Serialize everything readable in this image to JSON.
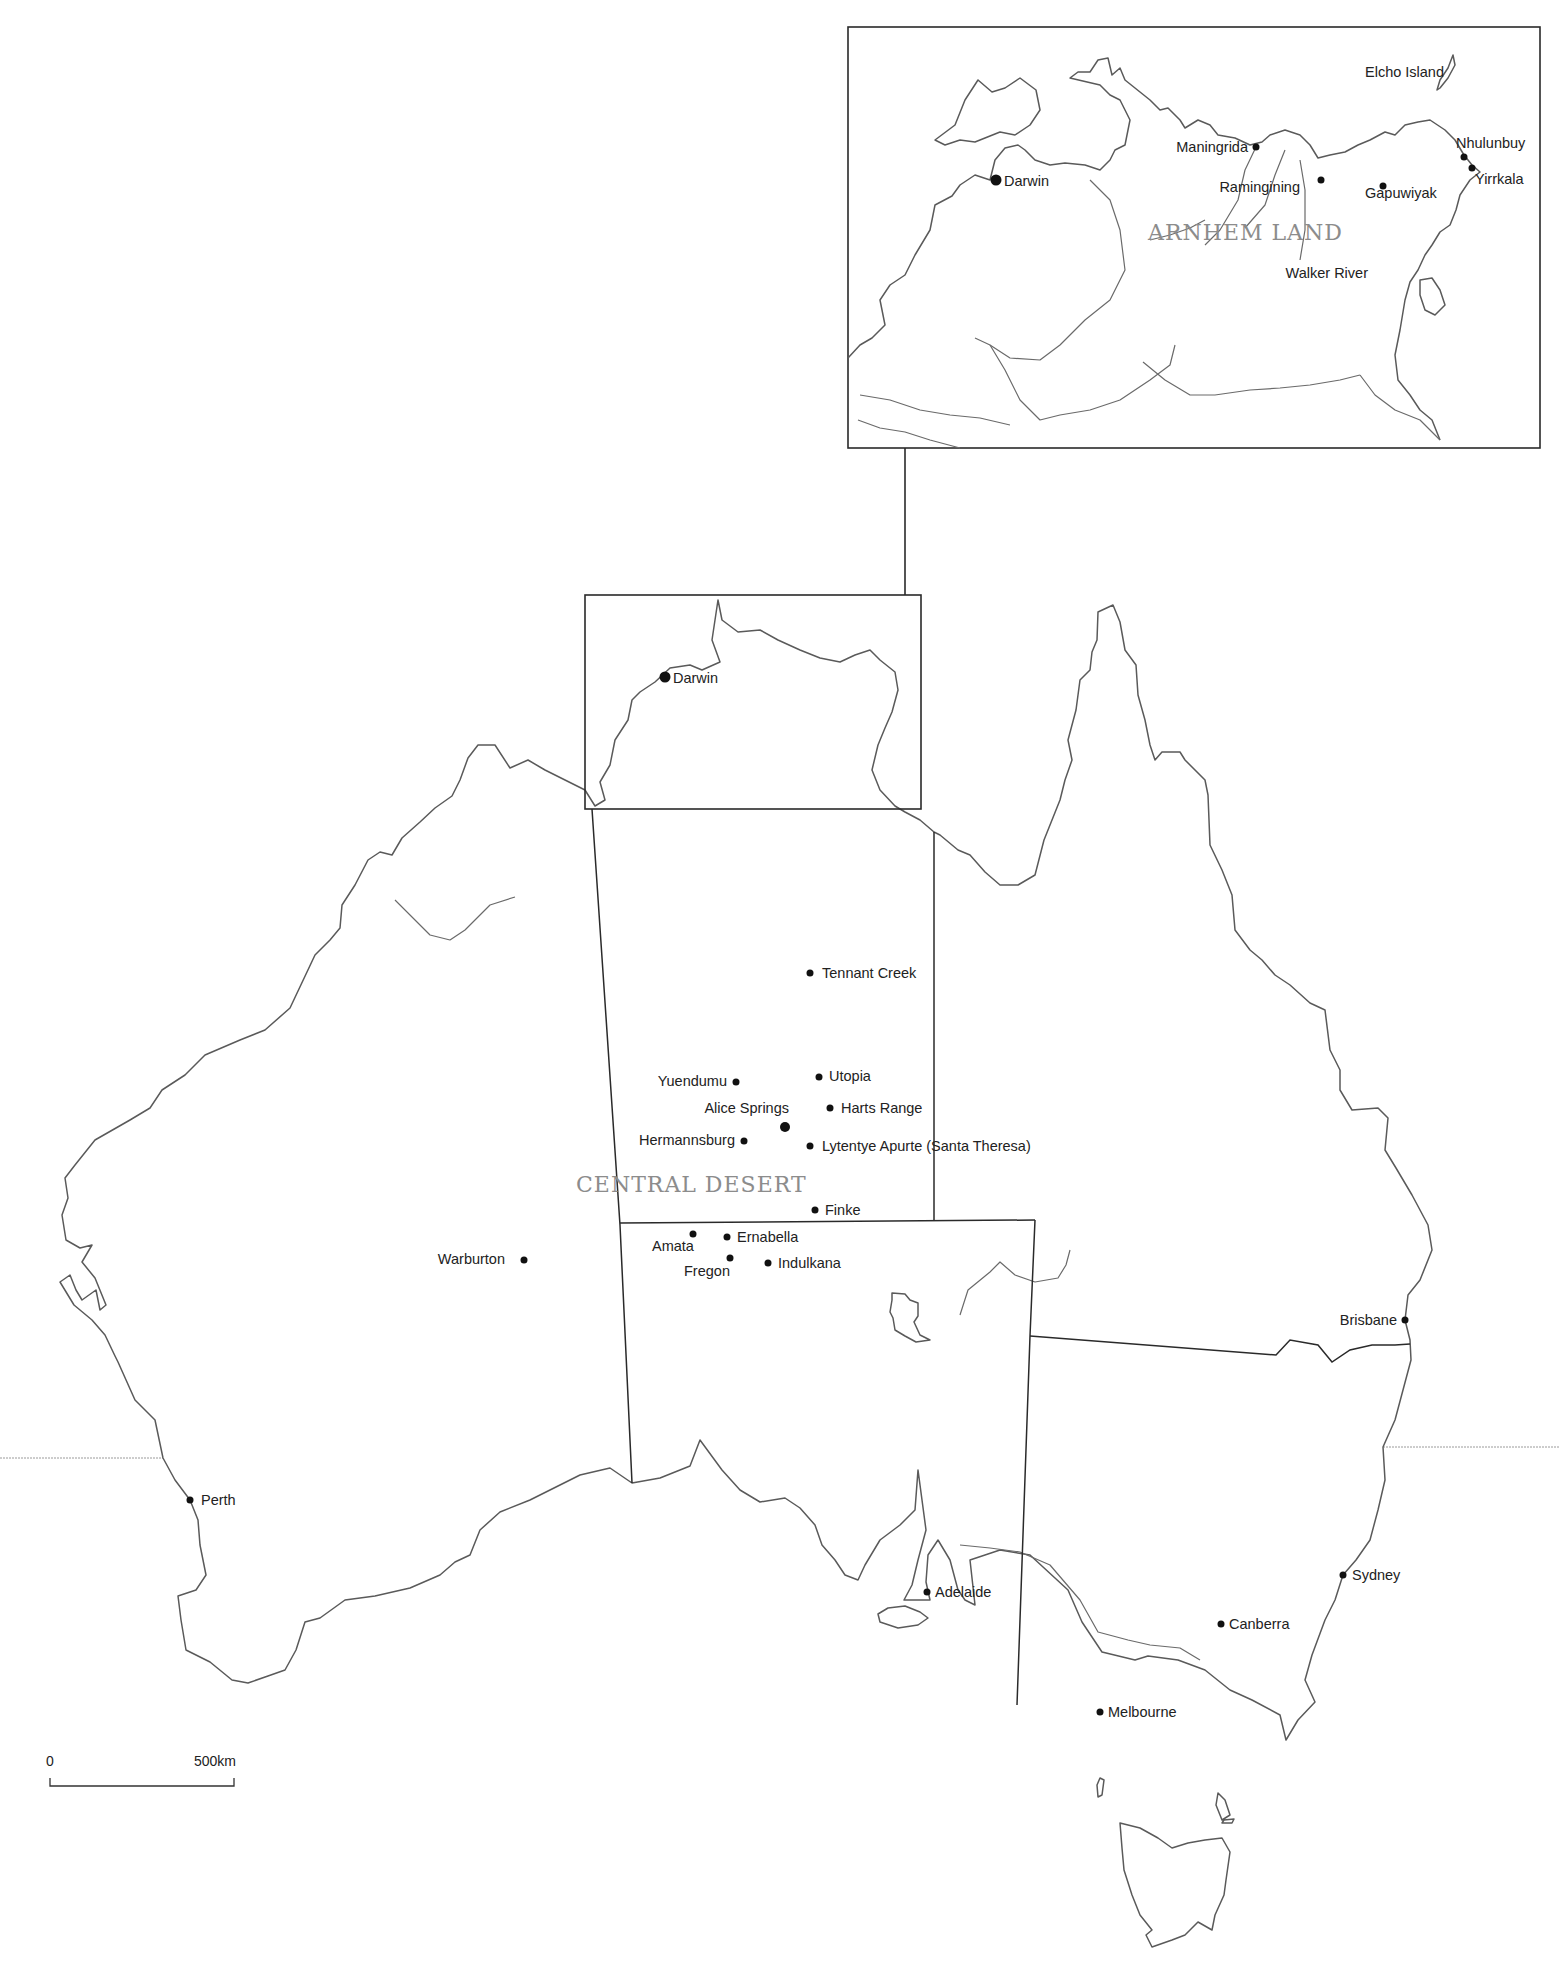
{
  "map": {
    "title": "Australia with Arnhem Land inset and Central Desert region",
    "colors": {
      "line": "#5a5a5a",
      "border": "#2a2a2a",
      "label": "#222222",
      "region_label": "#8c8c8c",
      "tropic": "#9a9a9a"
    },
    "regions": [
      {
        "id": "arnhem-land",
        "label": "ARNHEM LAND",
        "x": 1148,
        "y": 240
      },
      {
        "id": "central-desert",
        "label": "CENTRAL DESERT",
        "x": 576,
        "y": 1192
      }
    ],
    "main_places": [
      {
        "name": "Darwin",
        "dot": [
          665,
          677
        ],
        "r": 5.5,
        "label": [
          673,
          683
        ],
        "anchor": "start"
      },
      {
        "name": "Tennant Creek",
        "dot": [
          810,
          973
        ],
        "r": 3.5,
        "label": [
          822,
          978
        ],
        "anchor": "start"
      },
      {
        "name": "Yuendumu",
        "dot": [
          736,
          1082
        ],
        "r": 3.5,
        "label": [
          727,
          1086
        ],
        "anchor": "end"
      },
      {
        "name": "Utopia",
        "dot": [
          819,
          1077
        ],
        "r": 3.5,
        "label": [
          829,
          1081
        ],
        "anchor": "start"
      },
      {
        "name": "Alice Springs",
        "dot": [
          785,
          1127
        ],
        "r": 5,
        "label": [
          789,
          1113
        ],
        "anchor": "end"
      },
      {
        "name": "Harts Range",
        "dot": [
          830,
          1108
        ],
        "r": 3.5,
        "label": [
          841,
          1113
        ],
        "anchor": "start"
      },
      {
        "name": "Hermannsburg",
        "dot": [
          744,
          1141
        ],
        "r": 3.5,
        "label": [
          735,
          1145
        ],
        "anchor": "end"
      },
      {
        "name": "Lytentye Apurte (Santa Theresa)",
        "dot": [
          810,
          1146
        ],
        "r": 3.5,
        "label": [
          822,
          1151
        ],
        "anchor": "start"
      },
      {
        "name": "Finke",
        "dot": [
          815,
          1210
        ],
        "r": 3.5,
        "label": [
          825,
          1215
        ],
        "anchor": "start"
      },
      {
        "name": "Amata",
        "dot": [
          693,
          1234
        ],
        "r": 3.5,
        "label": [
          652,
          1251
        ],
        "anchor": "start"
      },
      {
        "name": "Ernabella",
        "dot": [
          727,
          1237
        ],
        "r": 3.5,
        "label": [
          737,
          1242
        ],
        "anchor": "start"
      },
      {
        "name": "Fregon",
        "dot": [
          730,
          1258
        ],
        "r": 3.5,
        "label": [
          684,
          1276
        ],
        "anchor": "start"
      },
      {
        "name": "Indulkana",
        "dot": [
          768,
          1263
        ],
        "r": 3.5,
        "label": [
          778,
          1268
        ],
        "anchor": "start"
      },
      {
        "name": "Warburton",
        "dot": [
          524,
          1260
        ],
        "r": 3.5,
        "label": [
          505,
          1264
        ],
        "anchor": "end"
      },
      {
        "name": "Brisbane",
        "dot": [
          1405,
          1320
        ],
        "r": 3.5,
        "label": [
          1397,
          1325
        ],
        "anchor": "end"
      },
      {
        "name": "Perth",
        "dot": [
          190,
          1500
        ],
        "r": 3.5,
        "label": [
          201,
          1505
        ],
        "anchor": "start"
      },
      {
        "name": "Sydney",
        "dot": [
          1343,
          1575
        ],
        "r": 3.5,
        "label": [
          1352,
          1580
        ],
        "anchor": "start"
      },
      {
        "name": "Adelaide",
        "dot": [
          927,
          1592
        ],
        "r": 3.5,
        "label": [
          935,
          1597
        ],
        "anchor": "start"
      },
      {
        "name": "Canberra",
        "dot": [
          1221,
          1624
        ],
        "r": 3.5,
        "label": [
          1229,
          1629
        ],
        "anchor": "start"
      },
      {
        "name": "Melbourne",
        "dot": [
          1100,
          1712
        ],
        "r": 3.5,
        "label": [
          1108,
          1717
        ],
        "anchor": "start"
      }
    ],
    "inset_places": [
      {
        "name": "Darwin",
        "dot": [
          996,
          180
        ],
        "r": 5.5,
        "label": [
          1004,
          186
        ],
        "anchor": "start"
      },
      {
        "name": "Maningrida",
        "dot": [
          1256,
          147
        ],
        "r": 3.5,
        "label": [
          1248,
          152
        ],
        "anchor": "end"
      },
      {
        "name": "Ramingining",
        "dot": [
          1321,
          180
        ],
        "r": 3.5,
        "label": [
          1300,
          192
        ],
        "anchor": "end"
      },
      {
        "name": "Gapuwiyak",
        "dot": [
          1383,
          186
        ],
        "r": 3.5,
        "label": [
          1365,
          198
        ],
        "anchor": "start"
      },
      {
        "name": "Nhulunbuy",
        "dot": [
          1464,
          157
        ],
        "r": 3.5,
        "label": [
          1456,
          148
        ],
        "anchor": "start"
      },
      {
        "name": "Yirrkala",
        "dot": [
          1472,
          168
        ],
        "r": 3.5,
        "label": [
          1475,
          184
        ],
        "anchor": "start"
      },
      {
        "name": "Elcho Island",
        "label": [
          1444,
          77
        ],
        "anchor": "end"
      },
      {
        "name": "Walker River",
        "label": [
          1368,
          278
        ],
        "anchor": "end"
      }
    ],
    "scale_bar": {
      "start_label": "0",
      "end_label": "500km",
      "x0": 50,
      "x1": 234,
      "y": 1786,
      "label_y": 1766
    },
    "inset_frame": {
      "x": 848,
      "y": 27,
      "w": 692,
      "h": 421
    },
    "locator_frame": {
      "x": 585,
      "y": 595,
      "w": 336,
      "h": 214
    },
    "connector": {
      "x": 905,
      "y1": 448,
      "y2": 595
    },
    "tropic_of_capricorn": {
      "west": [
        0,
        1458,
        163,
        1458
      ],
      "east": [
        1383,
        1447,
        1560,
        1447
      ]
    }
  }
}
